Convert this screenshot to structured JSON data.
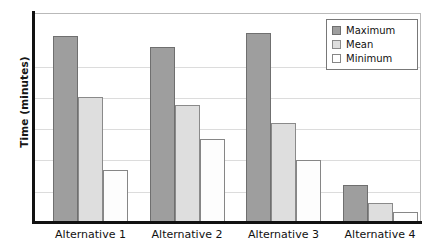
{
  "chart_data": {
    "type": "bar",
    "title": "",
    "xlabel": "",
    "ylabel": "Time (minutes)",
    "categories": [
      "Alternative 1",
      "Alternative 2",
      "Alternative 3",
      "Alternative 4"
    ],
    "series": [
      {
        "name": "Maximum",
        "color": "#9e9e9e",
        "values": [
          5.94,
          5.59,
          6.04,
          1.18
        ]
      },
      {
        "name": "Mean",
        "color": "#dedede",
        "values": [
          3.99,
          3.74,
          3.16,
          0.61
        ]
      },
      {
        "name": "Minimum",
        "color": "#ffffff",
        "values": [
          1.66,
          2.65,
          1.98,
          0.32
        ]
      }
    ],
    "ylim": [
      0,
      6.68
    ],
    "yticks": [
      1,
      2,
      3,
      4,
      5
    ],
    "ytick_labels": [
      "",
      "",
      "",
      "",
      ""
    ],
    "grid": true,
    "legend_position": "top-right",
    "legend_entries": [
      "Maximum",
      "Mean",
      "Minimum"
    ]
  },
  "axes": {
    "y_title": "Time (minutes)"
  },
  "legend": {
    "items": [
      {
        "label": "Maximum",
        "swatch": "maximum-swatch"
      },
      {
        "label": "Mean",
        "swatch": "mean-swatch"
      },
      {
        "label": "Minimum",
        "swatch": "minimum-swatch"
      }
    ]
  }
}
